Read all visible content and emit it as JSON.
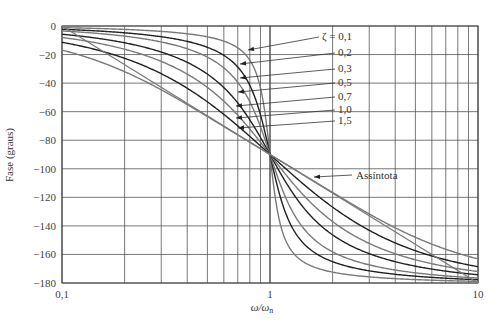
{
  "chart_data": {
    "type": "line",
    "title": "",
    "xlabel": "ω/ωn",
    "ylabel": "Fase (graus)",
    "xscale": "log",
    "xlim": [
      0.1,
      10
    ],
    "ylim": [
      -180,
      0
    ],
    "grid": true,
    "x_ticks": [
      "0,1",
      "1",
      "10"
    ],
    "y_ticks": [
      "0",
      "−20",
      "−40",
      "−60",
      "−80",
      "−100",
      "−120",
      "−140",
      "−160",
      "−180"
    ],
    "y_tick_values": [
      0,
      -20,
      -40,
      -60,
      -80,
      -100,
      -120,
      -140,
      -160,
      -180
    ],
    "formula": "phase = -atan2(2ζu, 1-u²) in degrees, u = ω/ωn",
    "series": [
      {
        "name": "ζ = 0,1",
        "zeta": 0.1,
        "color": "#7a7a7a",
        "label": "ζ = 0,1",
        "label_y": 40
      },
      {
        "name": "0,2",
        "zeta": 0.2,
        "color": "#222222",
        "label": "0,2",
        "label_y": 56
      },
      {
        "name": "0,3",
        "zeta": 0.3,
        "color": "#7a7a7a",
        "label": "0,3",
        "label_y": 72
      },
      {
        "name": "0,5",
        "zeta": 0.5,
        "color": "#222222",
        "label": "0,5",
        "label_y": 86
      },
      {
        "name": "0,7",
        "zeta": 0.7,
        "color": "#7a7a7a",
        "label": "0,7",
        "label_y": 100
      },
      {
        "name": "1,0",
        "zeta": 1.0,
        "color": "#222222",
        "label": "1,0",
        "label_y": 113
      },
      {
        "name": "1,5",
        "zeta": 1.5,
        "color": "#7a7a7a",
        "label": "1,5",
        "label_y": 124
      }
    ],
    "sample_values": {
      "x": [
        0.1,
        0.2,
        0.5,
        0.8,
        1,
        1.25,
        2,
        5,
        10
      ],
      "zeta_0.1": [
        -1.2,
        -2.4,
        -7.6,
        -24.0,
        -90,
        -156.0,
        -172.4,
        -177.6,
        -178.8
      ],
      "zeta_0.5": [
        -5.8,
        -11.8,
        -33.7,
        -65.8,
        -90,
        -114.2,
        -146.3,
        -168.2,
        -174.2
      ],
      "zeta_1.0": [
        -11.4,
        -22.6,
        -53.1,
        -77.3,
        -90,
        -102.7,
        -126.9,
        -157.4,
        -168.6
      ],
      "zeta_1.5": [
        -16.9,
        -32.0,
        -63.4,
        -83.7,
        -90,
        -96.4,
        -117.0,
        -152.0,
        -163.2
      ]
    },
    "annotations": [
      {
        "text": "Assíntota",
        "type": "line",
        "from": [
          0.1,
          0
        ],
        "to": [
          10,
          -180
        ]
      }
    ]
  },
  "labels": {
    "ylabel": "Fase (graus)",
    "xlabel_main": "ω/ω",
    "xlabel_sub": "n",
    "asymptote": "Assíntota",
    "x0": "0,1",
    "x1": "1",
    "x2": "10"
  }
}
